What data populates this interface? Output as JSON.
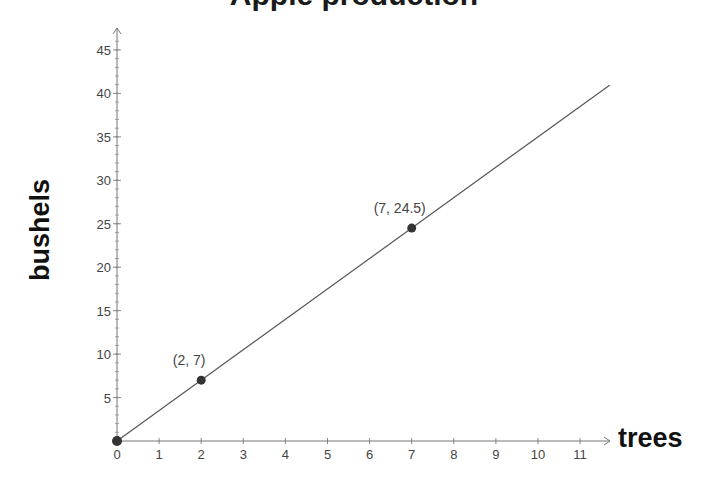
{
  "chart_data": {
    "type": "line",
    "title": "Apple production",
    "title_clipped": true,
    "xlabel": "trees",
    "ylabel": "bushels",
    "xlim": [
      0,
      11.7
    ],
    "ylim": [
      0,
      47
    ],
    "x_ticks": [
      0,
      1,
      2,
      3,
      4,
      5,
      6,
      7,
      8,
      9,
      10,
      11
    ],
    "y_ticks": [
      5,
      10,
      15,
      20,
      25,
      30,
      35,
      40,
      45
    ],
    "y_minor_step": 1,
    "grid": false,
    "legend": null,
    "series": [
      {
        "name": "bushels = 3.5 × trees",
        "slope": 3.5,
        "x": [
          0,
          11.7
        ],
        "y": [
          0,
          40.95
        ],
        "color": "#555555"
      }
    ],
    "points": [
      {
        "x": 0,
        "y": 0,
        "label": ""
      },
      {
        "x": 2,
        "y": 7,
        "label": "(2, 7)"
      },
      {
        "x": 7,
        "y": 24.5,
        "label": "(7, 24.5)"
      }
    ],
    "point_color": "#333333",
    "axis_color": "#777777",
    "tick_label_color": "#444444"
  },
  "layout": {
    "origin_px": [
      117,
      441
    ],
    "px_per_x": 42.1,
    "px_per_y": 8.69,
    "x_axis_end_px": 610,
    "y_axis_top_px": 28
  }
}
